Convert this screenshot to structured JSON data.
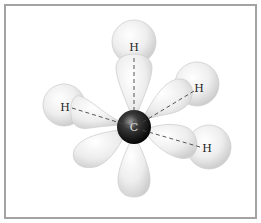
{
  "diagram": {
    "type": "molecular-orbital-diagram",
    "central_atom": {
      "label": "C",
      "x": 134,
      "y": 127,
      "r": 17
    },
    "bonded_atoms": [
      {
        "label": "H",
        "name": "top",
        "label_x": 134,
        "label_y": 51,
        "sphere_x": 134,
        "sphere_y": 42,
        "r": 22
      },
      {
        "label": "H",
        "name": "left",
        "label_x": 65,
        "label_y": 111,
        "sphere_x": 64,
        "sphere_y": 105,
        "r": 21
      },
      {
        "label": "H",
        "name": "upper-right",
        "label_x": 199,
        "label_y": 92,
        "sphere_x": 197,
        "sphere_y": 84,
        "r": 22
      },
      {
        "label": "H",
        "name": "lower-right",
        "label_x": 207,
        "label_y": 152,
        "sphere_x": 209,
        "sphere_y": 147,
        "r": 22
      }
    ],
    "colors": {
      "frame_border": "#a3a3a3",
      "lobe_fill": "#ececec",
      "lobe_stroke": "#cfcfcf",
      "carbon": "#1a1a1a",
      "bond_line": "#444444"
    }
  }
}
